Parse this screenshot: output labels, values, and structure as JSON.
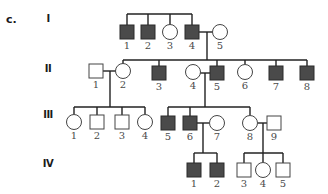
{
  "panel_label": "c.",
  "generations": [
    {
      "label": "I",
      "y": 20
    },
    {
      "label": "II",
      "y": 70
    },
    {
      "label": "III",
      "y": 117
    },
    {
      "label": "IV",
      "y": 165
    }
  ],
  "colors": {
    "affected": "#4a4a4a",
    "unaffected": "#ffffff",
    "line": "#222222"
  },
  "individuals": [
    {
      "id": "I-1",
      "gen": "I",
      "num": "1",
      "sex": "male",
      "affected": true,
      "cx": 127,
      "cy": 32
    },
    {
      "id": "I-2",
      "gen": "I",
      "num": "2",
      "sex": "male",
      "affected": true,
      "cx": 148,
      "cy": 32
    },
    {
      "id": "I-3",
      "gen": "I",
      "num": "3",
      "sex": "female",
      "affected": false,
      "cx": 170,
      "cy": 32
    },
    {
      "id": "I-4",
      "gen": "I",
      "num": "4",
      "sex": "male",
      "affected": true,
      "cx": 192,
      "cy": 32
    },
    {
      "id": "I-5",
      "gen": "I",
      "num": "5",
      "sex": "female",
      "affected": false,
      "cx": 220,
      "cy": 32
    },
    {
      "id": "II-1",
      "gen": "II",
      "num": "1",
      "sex": "male",
      "affected": false,
      "cx": 96,
      "cy": 71
    },
    {
      "id": "II-2",
      "gen": "II",
      "num": "2",
      "sex": "female",
      "affected": false,
      "cx": 123,
      "cy": 71
    },
    {
      "id": "II-3",
      "gen": "II",
      "num": "3",
      "sex": "male",
      "affected": true,
      "cx": 159,
      "cy": 73
    },
    {
      "id": "II-4",
      "gen": "II",
      "num": "4",
      "sex": "female",
      "affected": false,
      "cx": 193,
      "cy": 72
    },
    {
      "id": "II-5",
      "gen": "II",
      "num": "5",
      "sex": "male",
      "affected": true,
      "cx": 217,
      "cy": 73
    },
    {
      "id": "II-6",
      "gen": "II",
      "num": "6",
      "sex": "female",
      "affected": false,
      "cx": 245,
      "cy": 72
    },
    {
      "id": "II-7",
      "gen": "II",
      "num": "7",
      "sex": "male",
      "affected": true,
      "cx": 276,
      "cy": 73
    },
    {
      "id": "II-8",
      "gen": "II",
      "num": "8",
      "sex": "male",
      "affected": true,
      "cx": 307,
      "cy": 73
    },
    {
      "id": "III-1",
      "gen": "III",
      "num": "1",
      "sex": "female",
      "affected": false,
      "cx": 74,
      "cy": 122
    },
    {
      "id": "III-2",
      "gen": "III",
      "num": "2",
      "sex": "male",
      "affected": false,
      "cx": 97,
      "cy": 122
    },
    {
      "id": "III-3",
      "gen": "III",
      "num": "3",
      "sex": "male",
      "affected": false,
      "cx": 122,
      "cy": 122
    },
    {
      "id": "III-4",
      "gen": "III",
      "num": "4",
      "sex": "female",
      "affected": false,
      "cx": 145,
      "cy": 122
    },
    {
      "id": "III-5",
      "gen": "III",
      "num": "5",
      "sex": "male",
      "affected": true,
      "cx": 168,
      "cy": 123
    },
    {
      "id": "III-6",
      "gen": "III",
      "num": "6",
      "sex": "male",
      "affected": true,
      "cx": 190,
      "cy": 123
    },
    {
      "id": "III-7",
      "gen": "III",
      "num": "7",
      "sex": "female",
      "affected": false,
      "cx": 217,
      "cy": 123
    },
    {
      "id": "III-8",
      "gen": "III",
      "num": "8",
      "sex": "female",
      "affected": false,
      "cx": 250,
      "cy": 123
    },
    {
      "id": "III-9",
      "gen": "III",
      "num": "9",
      "sex": "male",
      "affected": false,
      "cx": 274,
      "cy": 123
    },
    {
      "id": "IV-1",
      "gen": "IV",
      "num": "1",
      "sex": "male",
      "affected": true,
      "cx": 194,
      "cy": 170
    },
    {
      "id": "IV-2",
      "gen": "IV",
      "num": "2",
      "sex": "male",
      "affected": true,
      "cx": 217,
      "cy": 170
    },
    {
      "id": "IV-3",
      "gen": "IV",
      "num": "3",
      "sex": "male",
      "affected": false,
      "cx": 244,
      "cy": 170
    },
    {
      "id": "IV-4",
      "gen": "IV",
      "num": "4",
      "sex": "female",
      "affected": false,
      "cx": 263,
      "cy": 170
    },
    {
      "id": "IV-5",
      "gen": "IV",
      "num": "5",
      "sex": "male",
      "affected": false,
      "cx": 283,
      "cy": 170
    }
  ],
  "lines": [
    [
      127,
      14,
      192,
      14
    ],
    [
      127,
      14,
      127,
      25
    ],
    [
      148,
      14,
      148,
      25
    ],
    [
      170,
      14,
      170,
      25
    ],
    [
      192,
      14,
      192,
      25
    ],
    [
      199,
      32,
      213,
      32
    ],
    [
      207,
      32,
      207,
      60
    ],
    [
      123,
      60,
      307,
      60
    ],
    [
      123,
      60,
      123,
      64
    ],
    [
      159,
      60,
      159,
      66
    ],
    [
      217,
      60,
      217,
      66
    ],
    [
      245,
      60,
      245,
      64
    ],
    [
      276,
      60,
      276,
      66
    ],
    [
      307,
      60,
      307,
      66
    ],
    [
      103,
      71,
      116,
      71
    ],
    [
      110,
      71,
      110,
      107
    ],
    [
      200,
      73,
      210,
      73
    ],
    [
      205,
      73,
      205,
      107
    ],
    [
      74,
      107,
      145,
      107
    ],
    [
      74,
      107,
      74,
      114
    ],
    [
      97,
      107,
      97,
      115
    ],
    [
      122,
      107,
      122,
      115
    ],
    [
      145,
      107,
      145,
      114
    ],
    [
      168,
      107,
      250,
      107
    ],
    [
      168,
      107,
      168,
      116
    ],
    [
      190,
      107,
      190,
      116
    ],
    [
      250,
      107,
      250,
      115
    ],
    [
      197,
      123,
      209,
      123
    ],
    [
      203,
      123,
      203,
      153
    ],
    [
      258,
      123,
      267,
      123
    ],
    [
      263,
      123,
      263,
      153
    ],
    [
      194,
      153,
      217,
      153
    ],
    [
      194,
      153,
      194,
      163
    ],
    [
      217,
      153,
      217,
      163
    ],
    [
      244,
      153,
      283,
      153
    ],
    [
      244,
      153,
      244,
      163
    ],
    [
      263,
      153,
      263,
      162
    ],
    [
      283,
      153,
      283,
      163
    ]
  ]
}
